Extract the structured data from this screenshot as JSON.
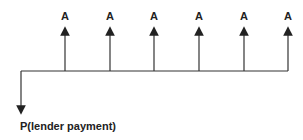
{
  "diagram": {
    "type": "cash-flow",
    "payments": [
      {
        "label": "A",
        "x": 65
      },
      {
        "label": "A",
        "x": 110
      },
      {
        "label": "A",
        "x": 154
      },
      {
        "label": "A",
        "x": 199
      },
      {
        "label": "A",
        "x": 244
      },
      {
        "label": "A",
        "x": 288
      }
    ],
    "initial": {
      "label": "P(lender payment)",
      "x": 21
    },
    "line_color": "#333333"
  }
}
